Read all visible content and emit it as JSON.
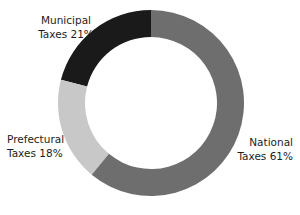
{
  "chart_data": {
    "type": "pie",
    "variant": "donut",
    "title": "",
    "xlabel": "",
    "ylabel": "",
    "legend": "none",
    "grid": false,
    "units": "percent",
    "total": 100,
    "start_angle_deg": 90,
    "direction": "counterclockwise",
    "inner_radius_ratio": 0.71,
    "categories": [
      "Municipal Taxes",
      "Prefectural Taxes",
      "National Taxes"
    ],
    "values": [
      21,
      18,
      61
    ],
    "colors": [
      "#1a1a1a",
      "#c8c8c8",
      "#6e6e6e"
    ],
    "slices": [
      {
        "name": "Municipal Taxes",
        "value": 21,
        "value_text": "21%",
        "color": "#1a1a1a",
        "label_line1": "Municipal",
        "label_line2": "Taxes 21%",
        "label_position": "top-left"
      },
      {
        "name": "Prefectural Taxes",
        "value": 18,
        "value_text": "18%",
        "color": "#c8c8c8",
        "label_line1": "Prefectural",
        "label_line2": "Taxes 18%",
        "label_position": "left"
      },
      {
        "name": "National Taxes",
        "value": 61,
        "value_text": "61%",
        "color": "#6e6e6e",
        "label_line1": "National",
        "label_line2": "Taxes 61%",
        "label_position": "right"
      }
    ]
  },
  "style": {
    "background": "#ffffff",
    "text_color": "#1d1d1d",
    "hole_color": "#ffffff"
  },
  "geometry": {
    "center_x": 151,
    "center_y": 103,
    "outer_radius": 93,
    "inner_radius": 66
  }
}
